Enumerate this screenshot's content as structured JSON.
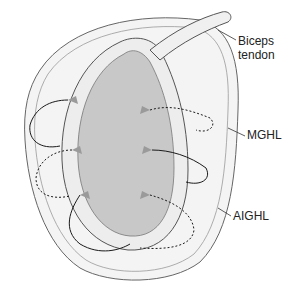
{
  "figure": {
    "colors": {
      "glenoid_fill": "#c8c8c8",
      "labrum_fill": "#f2f2f2",
      "outline": "#555555",
      "suture": "#1a1a1a",
      "anchor": "#9a9a9a"
    }
  },
  "labels": {
    "biceps_line1": "Biceps",
    "biceps_line2": "tendon",
    "mghl": "MGHL",
    "aighl": "AIGHL"
  }
}
